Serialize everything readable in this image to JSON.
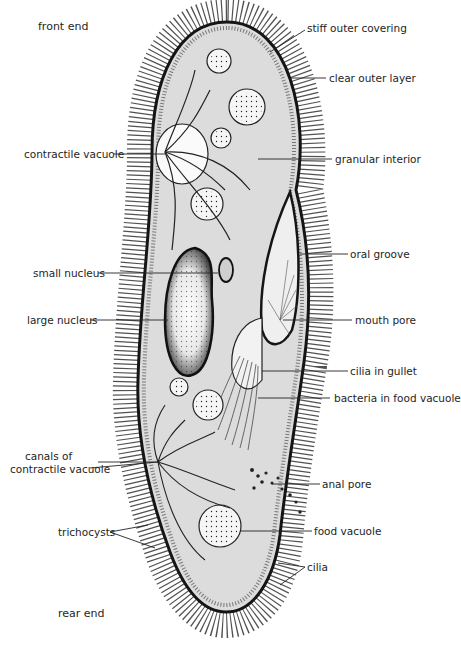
{
  "diagram": {
    "labels_left": [
      {
        "id": "front-end",
        "text": "front end"
      },
      {
        "id": "contractile-vacuole",
        "text": "contractile vacuole"
      },
      {
        "id": "small-nucleus",
        "text": "small nucleus"
      },
      {
        "id": "large-nucleus",
        "text": "large nucleus"
      },
      {
        "id": "canals-line1",
        "text": "canals  of"
      },
      {
        "id": "canals-line2",
        "text": "contractile vacuole"
      },
      {
        "id": "trichocysts",
        "text": "trichocysts"
      },
      {
        "id": "rear-end",
        "text": "rear end"
      }
    ],
    "labels_right": [
      {
        "id": "stiff-outer-covering",
        "text": "stiff outer  covering"
      },
      {
        "id": "clear-outer-layer",
        "text": "clear outer layer"
      },
      {
        "id": "granular-interior",
        "text": "granular interior"
      },
      {
        "id": "oral-groove",
        "text": "oral groove"
      },
      {
        "id": "mouth-pore",
        "text": "mouth  pore"
      },
      {
        "id": "cilia-in-gullet",
        "text": "cilia  in gullet"
      },
      {
        "id": "bacteria-in-food-vacuole",
        "text": "bacteria in food vacuole"
      },
      {
        "id": "anal-pore",
        "text": "anal pore"
      },
      {
        "id": "food-vacuole",
        "text": "food vacuole"
      },
      {
        "id": "cilia",
        "text": "cilia"
      }
    ],
    "colors": {
      "body_fill": "#dcdcdc",
      "outline": "#1a1a1a",
      "background": "#ffffff",
      "nucleus_fill": "#f4f4f4"
    }
  }
}
